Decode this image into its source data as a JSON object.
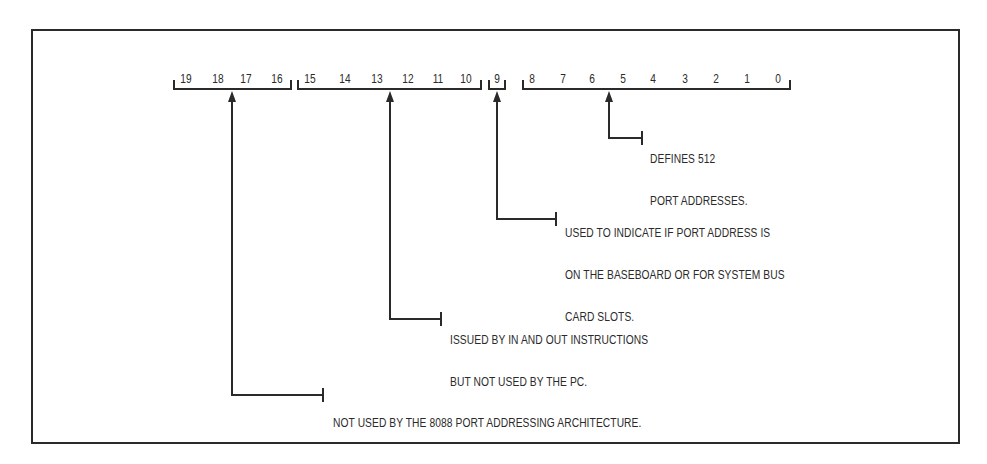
{
  "diagram": {
    "type": "port-address-bit-map",
    "bit_groups": [
      {
        "name": "bits-19-16",
        "bits": [
          "19",
          "18",
          "17",
          "16"
        ],
        "description_lines": [
          "NOT USED BY THE 8088 PORT ADDRESSING ARCHITECTURE."
        ]
      },
      {
        "name": "bits-15-10",
        "bits": [
          "15",
          "14",
          "13",
          "12",
          "11",
          "10"
        ],
        "description_lines": [
          "ISSUED BY IN AND OUT INSTRUCTIONS",
          "BUT NOT USED BY THE PC."
        ]
      },
      {
        "name": "bit-9",
        "bits": [
          "9"
        ],
        "description_lines": [
          "USED TO INDICATE IF PORT ADDRESS IS",
          "ON THE BASEBOARD OR FOR SYSTEM BUS",
          "CARD SLOTS."
        ]
      },
      {
        "name": "bits-8-0",
        "bits": [
          "8",
          "7",
          "6",
          "5",
          "4",
          "3",
          "2",
          "1",
          "0"
        ],
        "description_lines": [
          "DEFINES 512",
          "PORT ADDRESSES."
        ]
      }
    ],
    "colors": {
      "ink": "#2a2a2a",
      "background": "#ffffff"
    }
  }
}
